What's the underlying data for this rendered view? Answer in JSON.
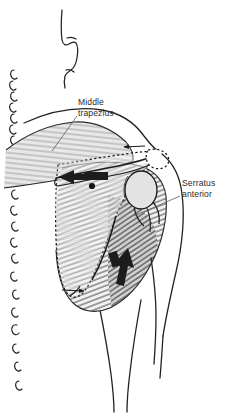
{
  "figure": {
    "type": "anatomical-illustration",
    "background_color": "#ffffff",
    "ink_color": "#1a1a1a",
    "label_text_color": "#2b2b2b",
    "leader_line_color": "#555555",
    "muscle_shade_color": "#b9b9b9",
    "bone_fill_color": "#ffffff",
    "humeral_head_fill": "#e3e3e3",
    "arrow_fill_color": "#1c1c1c"
  },
  "labels": [
    {
      "id": "middle-trapezius",
      "line1": "Middle",
      "line2": "trapezius",
      "x": 78,
      "y": 105
    },
    {
      "id": "serratus-anterior",
      "line1": "Serratus",
      "line2": "anterior",
      "x": 182,
      "y": 186
    }
  ],
  "annotations": {
    "force_arrows": [
      {
        "id": "trapezius-pull-arrow",
        "description": "Thick black arrow directed medially (left) along the scapular spine",
        "direction": "left"
      },
      {
        "id": "serratus-pull-arrow",
        "description": "Thick black arrow directed superolaterally (up and right) over the lateral border",
        "direction": "up-right"
      }
    ],
    "motion_arrows": [
      {
        "id": "superior-angle-arrow",
        "description": "Thin arrow near the acromion pointing left",
        "direction": "left"
      },
      {
        "id": "inferior-angle-arrow",
        "description": "Thin arrow at the inferior angle pointing right",
        "direction": "right"
      }
    ],
    "structures": [
      {
        "id": "vertebral-spinous-processes",
        "description": "Column of small hook-shaped spinous process outlines along the left margin"
      },
      {
        "id": "scapula-outline",
        "description": "Dotted outline of the scapula seen through the overlying muscle"
      },
      {
        "id": "scapular-spine",
        "description": "Ridge running obliquely across the upper scapula"
      },
      {
        "id": "humeral-head",
        "description": "Light gray oval representing the head of the humerus"
      },
      {
        "id": "trapezius-fibers",
        "description": "Horizontal striations of the middle trapezius running to the medial border"
      },
      {
        "id": "serratus-rib-striations",
        "description": "Dense oblique striations of the rib cage and serratus anterior"
      },
      {
        "id": "neck-contour",
        "description": "Line of the neck and occiput at the top of the figure"
      },
      {
        "id": "arm-contour",
        "description": "Outline of the upper arm descending on the right"
      },
      {
        "id": "torso-contour",
        "description": "Outline of the lateral trunk"
      }
    ]
  }
}
